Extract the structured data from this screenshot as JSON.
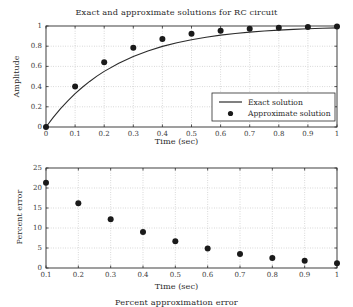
{
  "figure": {
    "width": 353,
    "height": 301,
    "background": "#ffffff",
    "ink_color": "#2b2b2b",
    "grid_color": "#b0b0b0",
    "marker_color": "#1a1a1a"
  },
  "chart_data": [
    {
      "type": "line",
      "title": "Exact and approximate solutions for RC circuit",
      "xlabel": "Time (sec)",
      "ylabel": "Amplitude",
      "xlim": [
        0,
        1
      ],
      "ylim": [
        0,
        1
      ],
      "xticks": [
        0,
        0.1,
        0.2,
        0.3,
        0.4,
        0.5,
        0.6,
        0.7,
        0.8,
        0.9,
        1
      ],
      "xticklabels": [
        "0",
        "0.1",
        "0.2",
        "0.3",
        "0.4",
        "0.5",
        "0.6",
        "0.7",
        "0.8",
        "0.9",
        "1"
      ],
      "yticks": [
        0,
        0.2,
        0.4,
        0.6,
        0.8,
        1
      ],
      "yticklabels": [
        "0",
        "0.2",
        "0.4",
        "0.6",
        "0.8",
        "1"
      ],
      "grid": true,
      "grid_style": "dotted",
      "legend_position": "lower right",
      "series": [
        {
          "name": "Exact solution",
          "style": "line",
          "x": [
            0,
            0.025,
            0.05,
            0.075,
            0.1,
            0.125,
            0.15,
            0.175,
            0.2,
            0.25,
            0.3,
            0.35,
            0.4,
            0.45,
            0.5,
            0.55,
            0.6,
            0.65,
            0.7,
            0.75,
            0.8,
            0.85,
            0.9,
            0.95,
            1
          ],
          "y": [
            0,
            0.0952,
            0.1813,
            0.2592,
            0.3297,
            0.3935,
            0.4512,
            0.5034,
            0.5507,
            0.6321,
            0.6988,
            0.7534,
            0.7981,
            0.8347,
            0.8647,
            0.8892,
            0.9093,
            0.9257,
            0.9392,
            0.9502,
            0.9593,
            0.9667,
            0.9727,
            0.9776,
            0.9817
          ]
        },
        {
          "name": "Approximate solution",
          "style": "marker",
          "x": [
            0,
            0.1,
            0.2,
            0.3,
            0.4,
            0.5,
            0.6,
            0.7,
            0.8,
            0.9,
            1
          ],
          "y": [
            0,
            0.4,
            0.64,
            0.784,
            0.8704,
            0.9222,
            0.9533,
            0.972,
            0.9832,
            0.9899,
            0.9939
          ]
        }
      ]
    },
    {
      "type": "scatter",
      "title": "Percent approximation error",
      "xlabel": "Time (sec)",
      "ylabel": "Percent error",
      "xlim": [
        0.1,
        1
      ],
      "ylim": [
        0,
        25
      ],
      "xticks": [
        0.1,
        0.2,
        0.3,
        0.4,
        0.5,
        0.6,
        0.7,
        0.8,
        0.9,
        1
      ],
      "xticklabels": [
        "0.1",
        "0.2",
        "0.3",
        "0.4",
        "0.5",
        "0.6",
        "0.7",
        "0.8",
        "0.9",
        "1"
      ],
      "yticks": [
        0,
        5,
        10,
        15,
        20,
        25
      ],
      "yticklabels": [
        "0",
        "5",
        "10",
        "15",
        "20",
        "25"
      ],
      "grid": true,
      "grid_style": "dotted",
      "legend_position": "none",
      "series": [
        {
          "name": "Percent error",
          "style": "marker",
          "x": [
            0.1,
            0.2,
            0.3,
            0.4,
            0.5,
            0.6,
            0.7,
            0.8,
            0.9,
            1
          ],
          "y": [
            21.3,
            16.2,
            12.2,
            9.0,
            6.7,
            4.9,
            3.5,
            2.5,
            1.8,
            1.2
          ]
        }
      ]
    }
  ],
  "legend": {
    "entries": [
      {
        "label": "Exact solution",
        "marker": "line"
      },
      {
        "label": "Approximate solution",
        "marker": "dot"
      }
    ]
  }
}
